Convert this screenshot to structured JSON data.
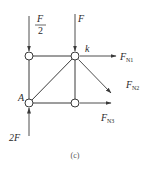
{
  "figure": {
    "caption": "(c)",
    "nodes": [
      {
        "id": "top-left"
      },
      {
        "id": "k",
        "label": "k"
      },
      {
        "id": "A",
        "label": "A"
      },
      {
        "id": "bottom-right"
      }
    ],
    "members": [
      {
        "from": "top-left",
        "to": "k"
      },
      {
        "from": "top-left",
        "to": "A"
      },
      {
        "from": "A",
        "to": "k"
      },
      {
        "from": "k",
        "to": "bottom-right"
      },
      {
        "from": "A",
        "to": "bottom-right"
      }
    ],
    "loads": {
      "half_f": {
        "numerator": "F",
        "denominator": "2",
        "direction": "down",
        "at": "top-left"
      },
      "f": {
        "label": "F",
        "direction": "down",
        "at": "k"
      },
      "two_f": {
        "label": "2F",
        "direction": "up",
        "at": "A"
      }
    },
    "internal_forces": {
      "fn1": {
        "main": "F",
        "sub": "N1",
        "direction": "right",
        "at": "k"
      },
      "fn2": {
        "main": "F",
        "sub": "N2",
        "direction": "down-right",
        "at": "k"
      },
      "fn3": {
        "main": "F",
        "sub": "N3",
        "direction": "right",
        "at": "bottom-right"
      }
    },
    "node_labels": {
      "k": "k",
      "A": "A"
    }
  }
}
